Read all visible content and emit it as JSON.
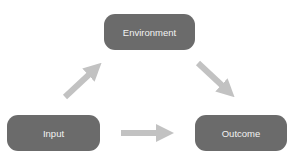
{
  "diagram": {
    "nodes": [
      {
        "id": "environment",
        "label": "Environment"
      },
      {
        "id": "input",
        "label": "Input"
      },
      {
        "id": "outcome",
        "label": "Outcome"
      }
    ],
    "edges": [
      {
        "from": "input",
        "to": "environment"
      },
      {
        "from": "environment",
        "to": "outcome"
      },
      {
        "from": "input",
        "to": "outcome"
      }
    ],
    "colors": {
      "node_fill": "#6b6b6b",
      "node_text": "#f2f2f2",
      "arrow": "#c2c2c2",
      "background": "#ffffff"
    }
  }
}
